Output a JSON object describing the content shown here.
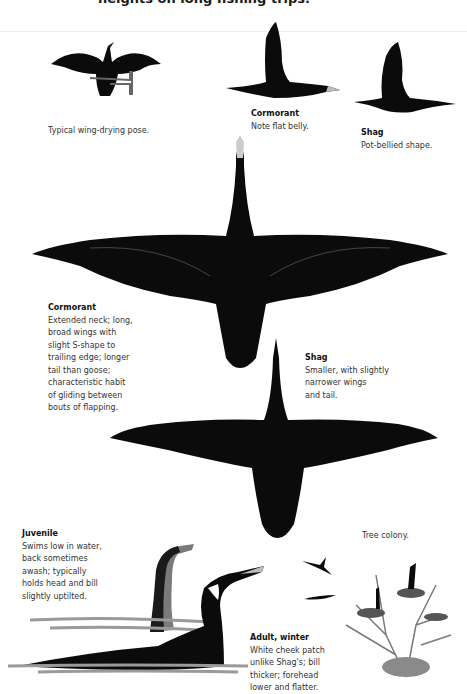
{
  "heading": "heights on long fishing trips.",
  "colors": {
    "background": "#ffffff",
    "bird_ink": "#0b0b0b",
    "text": "#333333",
    "water": "#9a9a9a",
    "tree": "#7a7a7a"
  },
  "illustrations": [
    {
      "id": "wing-drying",
      "caption": "Typical wing-drying pose."
    },
    {
      "id": "cormorant-side-flight",
      "title": "Cormorant",
      "caption": "Note flat belly."
    },
    {
      "id": "shag-side-flight",
      "title": "Shag",
      "caption": "Pot-bellied shape."
    },
    {
      "id": "cormorant-overhead",
      "title": "Cormorant",
      "caption": "Extended neck; long,\nbroad wings with\nslight S-shape to\ntrailing edge; longer\ntail than goose;\ncharacteristic habit\nof gliding between\nbouts of flapping."
    },
    {
      "id": "shag-overhead",
      "title": "Shag",
      "caption": "Smaller, with slightly\nnarrower wings\nand tail."
    },
    {
      "id": "juvenile-swimming",
      "title": "Juvenile",
      "caption": "Swims low in water,\nback sometimes\nawash; typically\nholds head and bill\nslightly uptilted."
    },
    {
      "id": "adult-winter-swimming",
      "title": "Adult, winter",
      "caption": "White cheek patch\nunlike Shag's; bill\nthicker; forehead\nlower and flatter."
    },
    {
      "id": "tree-colony",
      "caption": "Tree colony."
    }
  ]
}
